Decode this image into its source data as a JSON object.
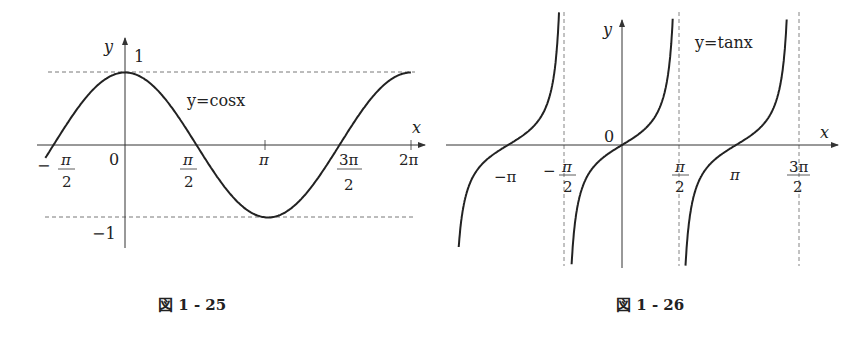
{
  "chart_data": [
    {
      "type": "line",
      "title": "y=cosx",
      "caption": "図 1 - 25",
      "xlabel": "x",
      "ylabel": "y",
      "x_ticks": [
        "-π/2",
        "0",
        "π/2",
        "π",
        "3π/2",
        "2π"
      ],
      "y_ticks": [
        "1",
        "-1"
      ],
      "xlim": [
        -1.85,
        6.35
      ],
      "ylim": [
        -1.4,
        1.4
      ],
      "dashed_lines": [
        "y=1",
        "y=-1"
      ],
      "series": [
        {
          "name": "y=cosx",
          "function": "cos(x)",
          "x_range": [
            -1.75,
            6.28
          ]
        }
      ],
      "grid": false
    },
    {
      "type": "line",
      "title": "y=tanx",
      "caption": "図 1 - 26",
      "xlabel": "x",
      "ylabel": "y",
      "x_ticks": [
        "-π",
        "-π/2",
        "0",
        "π/2",
        "π",
        "3π/2"
      ],
      "xlim": [
        -4.2,
        5.3
      ],
      "asymptotes": [
        "x=-π/2",
        "x=π/2",
        "x=3π/2"
      ],
      "series": [
        {
          "name": "y=tanx",
          "function": "tan(x)",
          "branches": [
            [
              -4.5,
              -1.62
            ],
            [
              -1.52,
              1.52
            ],
            [
              1.62,
              4.65
            ]
          ]
        }
      ],
      "grid": false
    }
  ],
  "left": {
    "curve_label": "y=cosx",
    "axis_x": "x",
    "axis_y": "y",
    "origin": "0",
    "one": "1",
    "minus_one": "−1",
    "ticks": {
      "neg_half_pi_sign": "−",
      "pi": "π",
      "pi_num": "π",
      "two": "2",
      "three_pi": "3π",
      "two_pi": "2π"
    },
    "caption": "図 1 - 25"
  },
  "right": {
    "curve_label": "y=tanx",
    "axis_x": "x",
    "axis_y": "y",
    "origin": "0",
    "ticks": {
      "neg_pi": "−π",
      "minus": "−",
      "pi": "π",
      "two": "2",
      "three_pi": "3π"
    },
    "caption": "図 1 - 26"
  }
}
